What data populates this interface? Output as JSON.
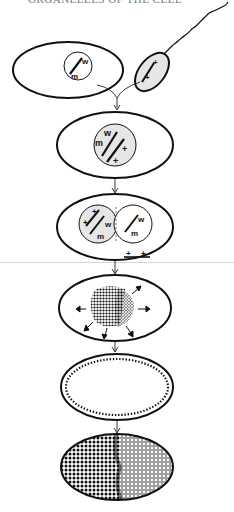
{
  "header": {
    "text": "ORGANELLES OF THE CELL"
  },
  "diagram": {
    "stages": [
      {
        "id": "gametes",
        "egg_nucleus_labels": [
          "w",
          "m"
        ],
        "sperm_labels": [
          "+",
          "+"
        ]
      },
      {
        "id": "zygote",
        "nucleus_labels": [
          "w",
          "m",
          "+",
          "+"
        ]
      },
      {
        "id": "fused-nuclei",
        "left_labels": [
          "+",
          "+",
          "w",
          "m"
        ],
        "right_labels": [
          "w",
          "m"
        ],
        "below_labels": [
          "+",
          "+"
        ]
      },
      {
        "id": "nuclear-division-burst"
      },
      {
        "id": "blastoderm-periphery"
      },
      {
        "id": "cellular-mosaic"
      }
    ],
    "colors": {
      "stroke": "#111111",
      "nucleus_fill": "#e6e6e6",
      "background": "#ffffff"
    }
  }
}
